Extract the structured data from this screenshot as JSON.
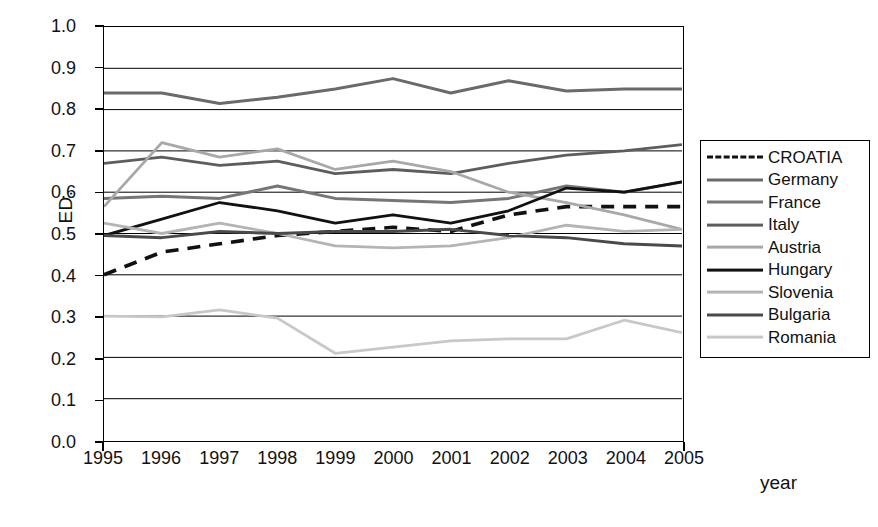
{
  "chart_data": {
    "type": "line",
    "title": "",
    "xlabel": "year",
    "ylabel": "ED.",
    "categories": [
      1995,
      1996,
      1997,
      1998,
      1999,
      2000,
      2001,
      2002,
      2003,
      2004,
      2005
    ],
    "xtick_labels": [
      "1995",
      "1996",
      "1997",
      "1998",
      "1999",
      "2000",
      "2001",
      "2002",
      "2003",
      "2004",
      "2005"
    ],
    "ytick_labels": [
      "1.0",
      "0.9",
      "0.8",
      "0.7",
      "0.6",
      "0.5",
      "0.4",
      "0.3",
      "0.2",
      "0.1",
      "0.0"
    ],
    "ylim": [
      0.0,
      1.0
    ],
    "xlim": [
      1995,
      2005
    ],
    "grid": "horizontal",
    "legend_position": "right-outside",
    "series": [
      {
        "name": "CROATIA",
        "color": "#111111",
        "width": 3.6,
        "style": "dashed",
        "values": [
          0.4,
          0.455,
          0.475,
          0.495,
          0.505,
          0.515,
          0.505,
          0.545,
          0.565,
          0.565,
          0.565
        ]
      },
      {
        "name": "Germany",
        "color": "#6a6a6a",
        "width": 3.0,
        "style": "solid",
        "values": [
          0.84,
          0.84,
          0.815,
          0.83,
          0.85,
          0.875,
          0.84,
          0.87,
          0.845,
          0.85,
          0.85
        ]
      },
      {
        "name": "France",
        "color": "#767676",
        "width": 3.0,
        "style": "solid",
        "values": [
          0.585,
          0.59,
          0.585,
          0.615,
          0.585,
          0.58,
          0.575,
          0.585,
          0.615,
          0.6,
          0.625
        ]
      },
      {
        "name": "Italy",
        "color": "#5d5d5d",
        "width": 2.8,
        "style": "solid",
        "values": [
          0.67,
          0.685,
          0.665,
          0.675,
          0.645,
          0.655,
          0.645,
          0.67,
          0.69,
          0.7,
          0.715
        ]
      },
      {
        "name": "Austria",
        "color": "#a8a8a8",
        "width": 2.8,
        "style": "solid",
        "values": [
          0.565,
          0.72,
          0.685,
          0.705,
          0.655,
          0.675,
          0.65,
          0.6,
          0.575,
          0.545,
          0.51
        ]
      },
      {
        "name": "Hungary",
        "color": "#111111",
        "width": 2.8,
        "style": "solid",
        "values": [
          0.495,
          0.535,
          0.575,
          0.555,
          0.525,
          0.545,
          0.525,
          0.555,
          0.61,
          0.6,
          0.625
        ]
      },
      {
        "name": "Slovenia",
        "color": "#b4b4b4",
        "width": 2.8,
        "style": "solid",
        "values": [
          0.525,
          0.5,
          0.525,
          0.5,
          0.47,
          0.465,
          0.47,
          0.49,
          0.52,
          0.505,
          0.51
        ]
      },
      {
        "name": "Bulgaria",
        "color": "#4a4a4a",
        "width": 3.0,
        "style": "solid",
        "values": [
          0.495,
          0.49,
          0.505,
          0.5,
          0.505,
          0.505,
          0.51,
          0.495,
          0.49,
          0.475,
          0.47
        ]
      },
      {
        "name": "Romania",
        "color": "#c8c8c8",
        "width": 2.8,
        "style": "solid",
        "values": [
          0.3,
          0.298,
          0.315,
          0.295,
          0.21,
          0.225,
          0.24,
          0.245,
          0.245,
          0.29,
          0.26
        ]
      }
    ]
  }
}
